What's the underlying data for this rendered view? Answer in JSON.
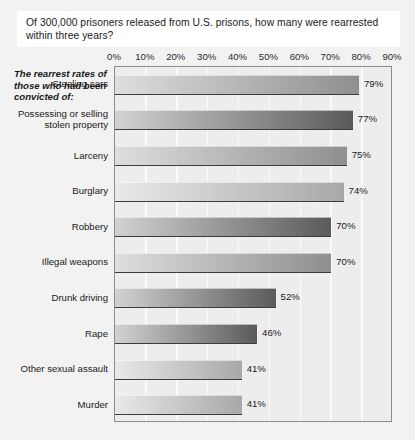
{
  "title": "Of 300,000 prisoners released from U.S. prisons, how many were rearrested within three years?",
  "subtitle": "The rearrest rates of those who had been convicted of:",
  "chart_data": {
    "type": "bar",
    "orientation": "horizontal",
    "title": "Of 300,000 prisoners released from U.S. prisons, how many were rearrested within three years?",
    "subtitle": "The rearrest rates of those who had been convicted of:",
    "xlabel": "",
    "ylabel": "",
    "xlim": [
      0,
      90
    ],
    "grid": true,
    "legend": false,
    "unit": "%",
    "tick_labels": [
      "0%",
      "10%",
      "20%",
      "30%",
      "40%",
      "50%",
      "60%",
      "70%",
      "80%",
      "90%"
    ],
    "ticks": [
      0,
      10,
      20,
      30,
      40,
      50,
      60,
      70,
      80,
      90
    ],
    "categories": [
      "Stealing cars",
      "Possessing or selling stolen property",
      "Larceny",
      "Burglary",
      "Robbery",
      "Illegal weapons",
      "Drunk driving",
      "Rape",
      "Other sexual assault",
      "Murder"
    ],
    "values": [
      79,
      77,
      75,
      74,
      70,
      70,
      52,
      46,
      41,
      41
    ],
    "value_labels": [
      "79%",
      "77%",
      "75%",
      "74%",
      "70%",
      "70%",
      "52%",
      "46%",
      "41%",
      "41%"
    ],
    "bar_shade": [
      "medium",
      "dark",
      "medium",
      "light",
      "dark",
      "medium",
      "dark",
      "dark",
      "light",
      "light"
    ]
  },
  "colors": {
    "page_background": "#f2f2f2",
    "card_background": "#ffffff",
    "plot_background": "#ededed",
    "plot_border": "#8c8c8c",
    "gridline": "#fbfbfb",
    "bar_light_start": "#e9e9e9",
    "bar_light_end": "#a8a8a8",
    "bar_medium_start": "#dedede",
    "bar_medium_end": "#8f8f8f",
    "bar_dark_start": "#d2d2d2",
    "bar_dark_end": "#5a5a5a",
    "text": "#1a1a1a"
  }
}
